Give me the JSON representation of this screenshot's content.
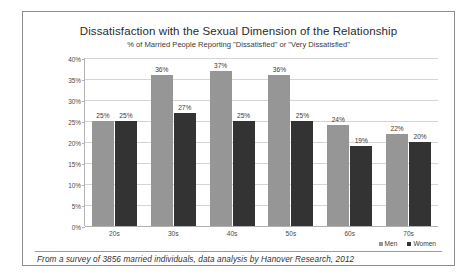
{
  "chart_data": {
    "type": "bar",
    "title": "Dissatisfaction with the Sexual Dimension of the Relationship",
    "subtitle": "% of Married People Reporting \"Dissatisfied\" or \"Very Dissatisfied\"",
    "categories": [
      "20s",
      "30s",
      "40s",
      "50s",
      "60s",
      "70s"
    ],
    "series": [
      {
        "name": "Men",
        "color": "#969696",
        "values": [
          25,
          36,
          37,
          36,
          24,
          22
        ]
      },
      {
        "name": "Women",
        "color": "#333333",
        "values": [
          25,
          27,
          25,
          25,
          19,
          20
        ]
      }
    ],
    "value_labels": {
      "Men": [
        "25%",
        "36%",
        "37%",
        "36%",
        "24%",
        "22%"
      ],
      "Women": [
        "25%",
        "27%",
        "25%",
        "25%",
        "19%",
        "20%"
      ]
    },
    "xlabel": "",
    "ylabel": "",
    "ylim": [
      0,
      40
    ],
    "ytick_values": [
      40,
      35,
      30,
      25,
      20,
      15,
      10,
      5,
      0
    ],
    "ytick_labels": [
      "40%",
      "35%",
      "30%",
      "25%",
      "20%",
      "15%",
      "10%",
      "5%",
      "0%"
    ],
    "grid": true,
    "legend_position": "bottom-right"
  },
  "footer": {
    "note": "From a survey of 3856 married individuals, data analysis by Hanover Research, 2012"
  }
}
